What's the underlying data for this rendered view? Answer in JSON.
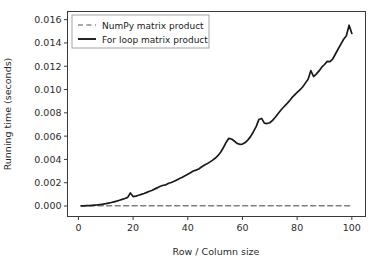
{
  "chart_data": {
    "type": "line",
    "title": "",
    "xlabel": "Row / Column size",
    "ylabel": "Running time (seconds)",
    "xlim": [
      -4,
      105
    ],
    "ylim": [
      -0.0009,
      0.0167
    ],
    "xticks": [
      0,
      20,
      40,
      60,
      80,
      100
    ],
    "xtick_labels": [
      "0",
      "20",
      "40",
      "60",
      "80",
      "100"
    ],
    "yticks": [
      0.0,
      0.002,
      0.004,
      0.006,
      0.008,
      0.01,
      0.012,
      0.014,
      0.016
    ],
    "ytick_labels": [
      "0.000",
      "0.002",
      "0.004",
      "0.006",
      "0.008",
      "0.010",
      "0.012",
      "0.014",
      "0.016"
    ],
    "grid": false,
    "legend_position": "upper left",
    "series": [
      {
        "name": "NumPy matrix product",
        "style": "dashed",
        "color": "#808080",
        "x": [
          1,
          10,
          20,
          30,
          40,
          50,
          60,
          70,
          80,
          90,
          100
        ],
        "values": [
          2e-05,
          2e-05,
          2e-05,
          2e-05,
          2e-05,
          2e-05,
          2e-05,
          2e-05,
          3e-05,
          3e-05,
          3e-05
        ]
      },
      {
        "name": "For loop matrix product",
        "style": "solid",
        "color": "#1a1a1a",
        "x": [
          1,
          2,
          3,
          4,
          5,
          6,
          7,
          8,
          9,
          10,
          11,
          12,
          13,
          14,
          15,
          16,
          17,
          18,
          19,
          20,
          21,
          22,
          23,
          24,
          25,
          26,
          27,
          28,
          29,
          30,
          31,
          32,
          33,
          34,
          35,
          36,
          37,
          38,
          39,
          40,
          41,
          42,
          43,
          44,
          45,
          46,
          47,
          48,
          49,
          50,
          51,
          52,
          53,
          54,
          55,
          56,
          57,
          58,
          59,
          60,
          61,
          62,
          63,
          64,
          65,
          66,
          67,
          68,
          69,
          70,
          71,
          72,
          73,
          74,
          75,
          76,
          77,
          78,
          79,
          80,
          81,
          82,
          83,
          84,
          85,
          86,
          87,
          88,
          89,
          90,
          91,
          92,
          93,
          94,
          95,
          96,
          97,
          98,
          99,
          100
        ],
        "values": [
          1e-05,
          2e-05,
          3e-05,
          4e-05,
          6e-05,
          8e-05,
          0.0001,
          0.00013,
          0.00016,
          0.0002,
          0.00025,
          0.0003,
          0.00036,
          0.00042,
          0.00049,
          0.00057,
          0.00065,
          0.00074,
          0.00112,
          0.00081,
          0.00085,
          0.00092,
          0.001,
          0.00108,
          0.00117,
          0.00127,
          0.00136,
          0.00147,
          0.00158,
          0.0017,
          0.00178,
          0.00182,
          0.00195,
          0.00202,
          0.00212,
          0.00224,
          0.00236,
          0.00247,
          0.0026,
          0.00272,
          0.00286,
          0.003,
          0.00308,
          0.00318,
          0.00335,
          0.0035,
          0.00362,
          0.00377,
          0.00392,
          0.0041,
          0.00432,
          0.00462,
          0.005,
          0.00546,
          0.00581,
          0.00575,
          0.00558,
          0.00538,
          0.0053,
          0.00532,
          0.00545,
          0.00568,
          0.00598,
          0.00638,
          0.00682,
          0.00742,
          0.00752,
          0.00712,
          0.00708,
          0.00715,
          0.00735,
          0.00762,
          0.00792,
          0.00822,
          0.00848,
          0.00872,
          0.00898,
          0.00928,
          0.00952,
          0.00975,
          0.00998,
          0.01022,
          0.01055,
          0.01088,
          0.01162,
          0.01112,
          0.01132,
          0.0116,
          0.01192,
          0.01215,
          0.01242,
          0.0124,
          0.01262,
          0.01305,
          0.01348,
          0.0139,
          0.01432,
          0.01462,
          0.01552,
          0.01482
        ]
      }
    ]
  },
  "legend": {
    "entries": [
      {
        "label": "NumPy matrix product"
      },
      {
        "label": "For loop matrix product"
      }
    ]
  }
}
